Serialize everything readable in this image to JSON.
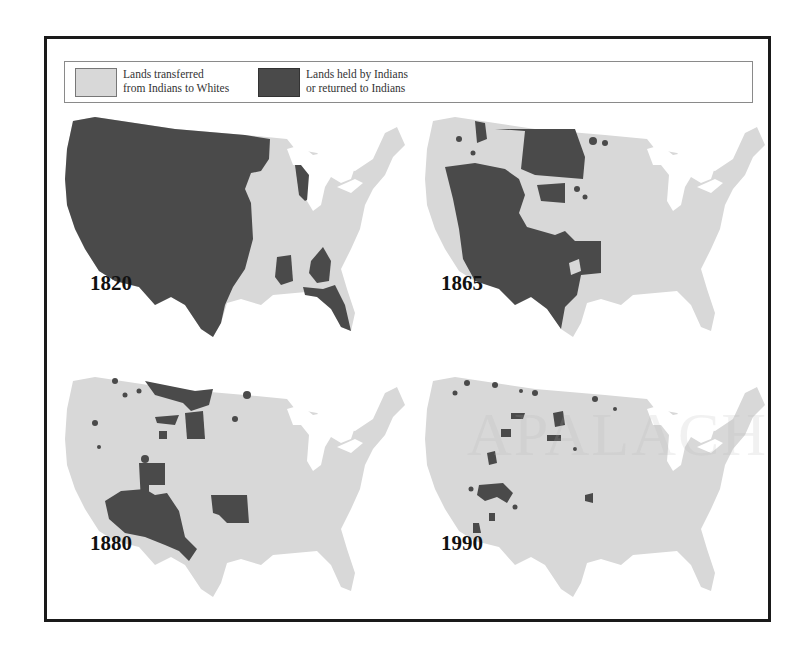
{
  "legend": {
    "items": [
      {
        "label_line1": "Lands transferred",
        "label_line2": "from Indians to Whites",
        "color": "#d8d8d8"
      },
      {
        "label_line1": "Lands held by Indians",
        "label_line2": "or returned to Indians",
        "color": "#4a4a4a"
      }
    ]
  },
  "maps": [
    {
      "year": "1820"
    },
    {
      "year": "1865"
    },
    {
      "year": "1880"
    },
    {
      "year": "1990"
    }
  ],
  "watermark": "APALACH",
  "colors": {
    "transferred": "#d8d8d8",
    "held": "#4a4a4a",
    "lakes": "#ffffff",
    "frame": "#1a1a1a"
  }
}
